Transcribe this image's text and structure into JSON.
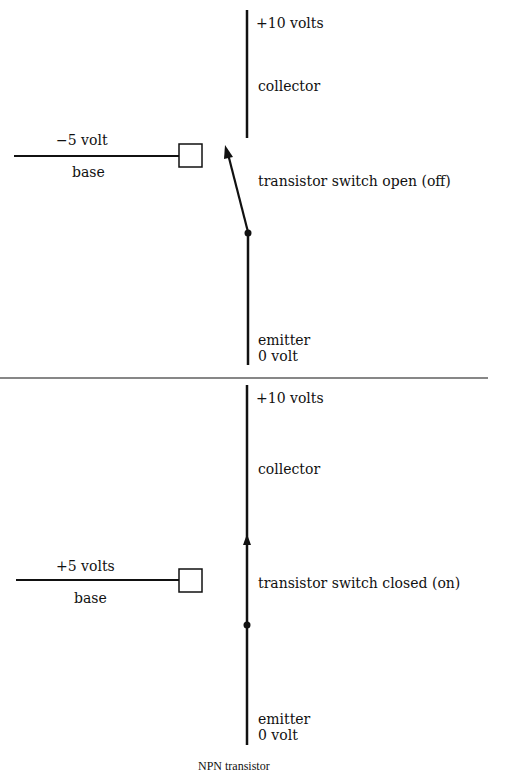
{
  "top_panel": {
    "collector_voltage": "+10 volts",
    "collector_label": "collector",
    "base_voltage": "−5 volt",
    "base_label": "base",
    "switch_state": "transistor switch open (off)",
    "emitter_label": "emitter",
    "emitter_voltage": "0 volt"
  },
  "bottom_panel": {
    "collector_voltage": "+10 volts",
    "collector_label": "collector",
    "base_voltage": "+5 volts",
    "base_label": "base",
    "switch_state": "transistor switch closed (on)",
    "emitter_label": "emitter",
    "emitter_voltage": "0 volt"
  },
  "caption": "NPN transistor",
  "colors": {
    "ink": "#111111",
    "background": "#ffffff"
  }
}
